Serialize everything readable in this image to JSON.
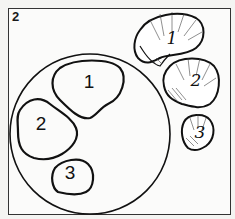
{
  "figure": {
    "panel_label": "2",
    "circle_regions": [
      {
        "label": "1"
      },
      {
        "label": "2"
      },
      {
        "label": "3"
      }
    ],
    "shells": [
      {
        "label": "1"
      },
      {
        "label": "2"
      },
      {
        "label": "3"
      }
    ],
    "colors": {
      "stroke": "#111111",
      "background": "#f4f4f2"
    }
  }
}
